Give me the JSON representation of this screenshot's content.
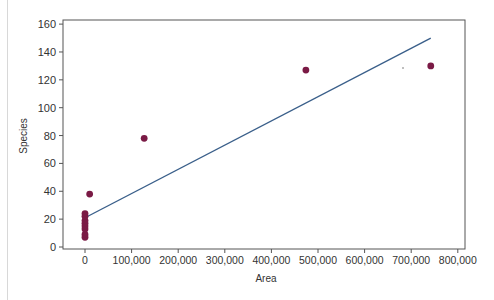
{
  "chart_data": {
    "type": "scatter",
    "title": "",
    "xlabel": "Area",
    "ylabel": "Species",
    "xlim": [
      -40000,
      800000
    ],
    "ylim": [
      0,
      160
    ],
    "x_ticks": [
      0,
      100000,
      200000,
      300000,
      400000,
      500000,
      600000,
      700000,
      800000
    ],
    "x_tick_labels": [
      "0",
      "100,000",
      "200,000",
      "300,000",
      "400,000",
      "500,000",
      "600,000",
      "700,000",
      "800,000"
    ],
    "y_ticks": [
      0,
      20,
      40,
      60,
      80,
      100,
      120,
      140,
      160
    ],
    "y_tick_labels": [
      "0",
      "20",
      "40",
      "60",
      "80",
      "100",
      "120",
      "140",
      "160"
    ],
    "grid": false,
    "legend": null,
    "series": [
      {
        "name": "Observations",
        "type": "scatter",
        "color": "#7a1a45",
        "points": [
          {
            "x": 0,
            "y": 7
          },
          {
            "x": 0,
            "y": 9
          },
          {
            "x": 0,
            "y": 13
          },
          {
            "x": 0,
            "y": 15
          },
          {
            "x": 0,
            "y": 17
          },
          {
            "x": 0,
            "y": 19
          },
          {
            "x": 0,
            "y": 22
          },
          {
            "x": 0,
            "y": 24
          },
          {
            "x": 10000,
            "y": 38
          },
          {
            "x": 127000,
            "y": 78
          },
          {
            "x": 474000,
            "y": 127
          },
          {
            "x": 742000,
            "y": 130
          }
        ]
      },
      {
        "name": "Regression line",
        "type": "line",
        "color": "#3a5f8a",
        "points": [
          {
            "x": 0,
            "y": 21
          },
          {
            "x": 742000,
            "y": 150
          }
        ]
      }
    ]
  },
  "axes": {
    "xlabel": "Area",
    "ylabel": "Species"
  }
}
